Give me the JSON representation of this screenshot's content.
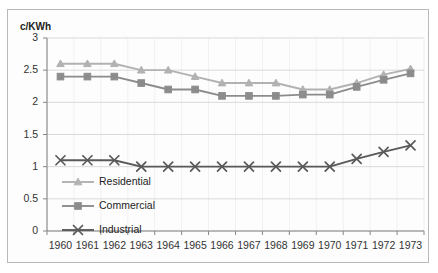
{
  "chart_data": {
    "type": "line",
    "title": "",
    "xlabel": "",
    "ylabel": "c/KWh",
    "ylim": [
      0,
      3
    ],
    "ytick_labels": [
      "0",
      "0.5",
      "1",
      "1.5",
      "2",
      "2.5",
      "3"
    ],
    "ytick_values": [
      0,
      0.5,
      1,
      1.5,
      2,
      2.5,
      3
    ],
    "grid": true,
    "legend_position": "inside-left",
    "categories": [
      "1960",
      "1961",
      "1962",
      "1963",
      "1964",
      "1965",
      "1966",
      "1967",
      "1968",
      "1969",
      "1970",
      "1971",
      "1972",
      "1973"
    ],
    "x": [
      1960,
      1961,
      1962,
      1963,
      1964,
      1965,
      1966,
      1967,
      1968,
      1969,
      1970,
      1971,
      1972,
      1973
    ],
    "series": [
      {
        "name": "Residential",
        "marker": "triangle",
        "color": "#b2b2b2",
        "values": [
          2.6,
          2.6,
          2.6,
          2.5,
          2.5,
          2.4,
          2.3,
          2.3,
          2.3,
          2.2,
          2.2,
          2.3,
          2.43,
          2.52
        ]
      },
      {
        "name": "Commercial",
        "marker": "square",
        "color": "#8c8c8c",
        "values": [
          2.4,
          2.4,
          2.4,
          2.3,
          2.2,
          2.2,
          2.1,
          2.1,
          2.1,
          2.12,
          2.12,
          2.24,
          2.35,
          2.45
        ]
      },
      {
        "name": "Industrial",
        "marker": "x",
        "color": "#595959",
        "values": [
          1.1,
          1.1,
          1.1,
          1.0,
          1.0,
          1.0,
          1.0,
          1.0,
          1.0,
          1.0,
          1.0,
          1.12,
          1.23,
          1.33
        ]
      }
    ]
  },
  "colors": {
    "plot_background": "#ffffff",
    "frame_border": "#b9b9b9",
    "grid": "#d9d9d9",
    "axis": "#868686",
    "tick_text": "#333333",
    "residential": "#b2b2b2",
    "commercial": "#8c8c8c",
    "industrial": "#595959"
  },
  "legend": {
    "items": [
      {
        "label": "Residential",
        "marker": "triangle",
        "color": "#b2b2b2"
      },
      {
        "label": "Commercial",
        "marker": "square",
        "color": "#8c8c8c"
      },
      {
        "label": "Industrial",
        "marker": "x",
        "color": "#595959"
      }
    ]
  }
}
